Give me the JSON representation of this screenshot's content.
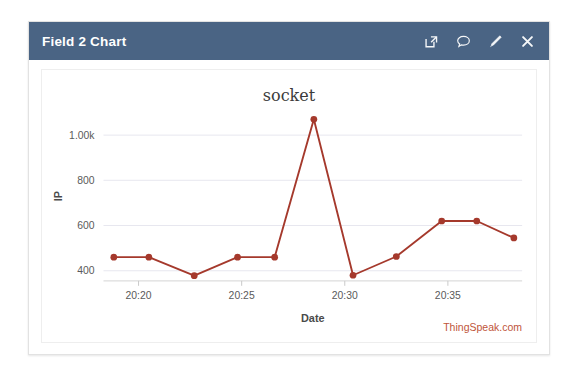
{
  "widget": {
    "title": "Field 2 Chart",
    "header_bg": "#4a6484",
    "actions": [
      {
        "name": "export-icon",
        "label": "Export"
      },
      {
        "name": "comment-icon",
        "label": "Comment"
      },
      {
        "name": "edit-icon",
        "label": "Edit"
      },
      {
        "name": "close-icon",
        "label": "Close"
      }
    ]
  },
  "watermark": "ThingSpeak.com",
  "chart_data": {
    "type": "line",
    "title": "socket",
    "xlabel": "Date",
    "ylabel": "IP",
    "grid": true,
    "legend": false,
    "line_color": "#a5392c",
    "marker_color": "#a5392c",
    "xtick_labels": [
      "20:20",
      "20:25",
      "20:30",
      "20:35"
    ],
    "xtick_values": [
      1220,
      1225,
      1230,
      1235
    ],
    "ytick_labels": [
      "400",
      "600",
      "800",
      "1.00k"
    ],
    "ytick_values": [
      400,
      600,
      800,
      1000
    ],
    "xlim": [
      1218.3,
      1238.6
    ],
    "ylim": [
      355,
      1105
    ],
    "x": [
      1218.8,
      1220.5,
      1222.7,
      1224.8,
      1226.6,
      1228.5,
      1230.4,
      1232.5,
      1234.7,
      1236.4,
      1238.2
    ],
    "x_labels": [
      "20:18.8",
      "20:20.5",
      "20:22.7",
      "20:24.8",
      "20:26.6",
      "20:28.5",
      "20:30.4",
      "20:32.5",
      "20:34.7",
      "20:36.4",
      "20:38.2"
    ],
    "values": [
      460,
      460,
      378,
      460,
      460,
      1070,
      380,
      463,
      620,
      620,
      545
    ],
    "series": [
      {
        "name": "socket",
        "values": [
          460,
          460,
          378,
          460,
          460,
          1070,
          380,
          463,
          620,
          620,
          545
        ]
      }
    ]
  }
}
